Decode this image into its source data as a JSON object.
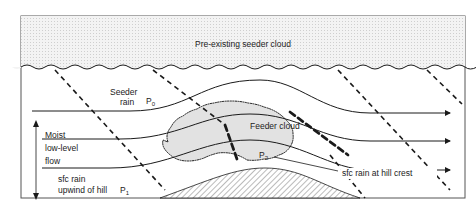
{
  "diagram": {
    "labels": {
      "seeder_cloud": "Pre-existing seeder cloud",
      "seeder_rain_1": "Seeder",
      "seeder_rain_2": "rain",
      "p0_main": "P",
      "p0_sub": "0",
      "feeder_cloud": "Feeder cloud",
      "p2_main": "P",
      "p2_sub": "2",
      "moist_1": "Moist",
      "moist_2": "low-level",
      "moist_3": "flow",
      "sfc_upwind_1": "sfc rain",
      "sfc_upwind_2": "upwind of hill",
      "p1_main": "P",
      "p1_sub": "1",
      "sfc_crest": "sfc rain at hill crest"
    },
    "colors": {
      "line": "#1a1a1a",
      "cloud_fill": "#ececec",
      "feeder_fill": "#e2e2e2",
      "frame": "#555555"
    }
  }
}
